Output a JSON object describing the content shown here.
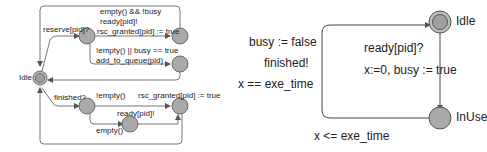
{
  "left_automaton": {
    "initial_state": "Idle",
    "edges": {
      "reserve": "reserve[pid]?",
      "guard_empty_not_busy": "empty() && !busy",
      "sync_ready": "ready[pid]!",
      "update_rsc_granted_top": "rsc_granted[pid] := true",
      "guard_not_empty_or_busy": "!empty() || busy == true",
      "update_add_to_queue": "add_to_queue(pid)",
      "finished": "finished?",
      "guard_not_empty": "!empty()",
      "update_rsc_granted_bottom": "rsc_granted[pid] := true",
      "sync_ready_bottom": "ready[pid]!",
      "guard_empty": "empty()"
    }
  },
  "right_automaton": {
    "states": {
      "idle": "Idle",
      "inuse": "InUse"
    },
    "edges": {
      "ready_sync": "ready[pid]?",
      "ready_update": "x:=0, busy := true",
      "return_update": "busy := false",
      "return_sync": "finished!",
      "return_guard": "x == exe_time"
    },
    "invariant": "x <= exe_time"
  },
  "colors": {
    "node_fill": "#a9a9a9",
    "node_stroke": "#6b6b6b",
    "edge": "#666666",
    "text": "#222222"
  }
}
